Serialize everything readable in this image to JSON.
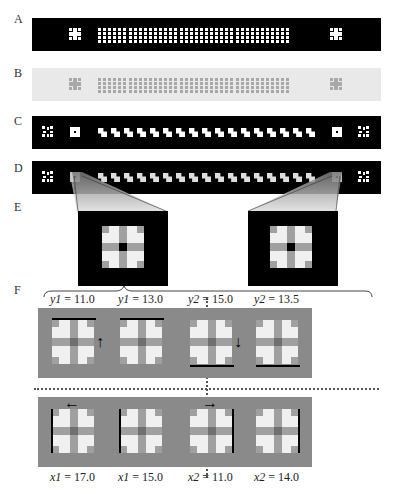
{
  "figure": {
    "panel_labels": [
      "A",
      "B",
      "C",
      "D",
      "E",
      "F"
    ],
    "strips": {
      "A": {
        "background": "#000000",
        "element_color": "#ffffff",
        "dot_rows": 4,
        "dot_cols": 38
      },
      "B": {
        "background": "#e9e9e9",
        "element_color": "#a8a8a8",
        "dot_rows": 4,
        "dot_cols": 38
      },
      "C": {
        "background": "#000000",
        "element_color": "#ffffff",
        "tiles": 17
      },
      "D": {
        "background": "#000000",
        "element_color": "#ffffff",
        "tiles": 17
      }
    },
    "zoom_panels": 2,
    "f_panels": {
      "top": [
        {
          "caption_var": "y1",
          "caption_val": "= 11.0",
          "arrow": "up",
          "bar": "top"
        },
        {
          "caption_var": "y1",
          "caption_val": "= 13.0",
          "arrow": "",
          "bar": "top"
        },
        {
          "caption_var": "y2",
          "caption_val": "= 15.0",
          "arrow": "down",
          "bar": "bottom"
        },
        {
          "caption_var": "y2",
          "caption_val": "= 13.5",
          "arrow": "",
          "bar": "bottom"
        }
      ],
      "bottom": [
        {
          "caption_var": "x1",
          "caption_val": "= 17.0",
          "arrow": "left",
          "bar": "left"
        },
        {
          "caption_var": "x1",
          "caption_val": "= 15.0",
          "arrow": "",
          "bar": "left"
        },
        {
          "caption_var": "x2",
          "caption_val": "= 11.0",
          "arrow": "right",
          "bar": "right"
        },
        {
          "caption_var": "x2",
          "caption_val": "= 14.0",
          "arrow": "",
          "bar": "right"
        }
      ]
    },
    "arrows": {
      "up": "↑",
      "down": "↓",
      "left": "←",
      "right": "→"
    }
  }
}
